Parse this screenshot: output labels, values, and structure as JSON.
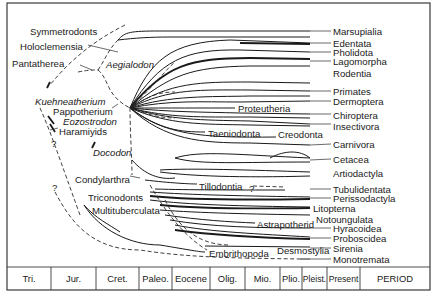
{
  "diagram": {
    "title": "",
    "frame": {
      "x": 7,
      "y": 3,
      "w": 423,
      "h": 287,
      "period_row_y": 267
    },
    "right_labels": [
      {
        "text": "Marsupialia",
        "y": 31
      },
      {
        "text": "Edentata",
        "y": 43
      },
      {
        "text": "Pholidota",
        "y": 52
      },
      {
        "text": "Lagomorpha",
        "y": 61
      },
      {
        "text": "Rodentia",
        "y": 73
      },
      {
        "text": "Primates",
        "y": 91
      },
      {
        "text": "Dermoptera",
        "y": 101
      },
      {
        "text": "Chiroptera",
        "y": 115
      },
      {
        "text": "Insectivora",
        "y": 126
      },
      {
        "text": "Carnivora",
        "y": 144
      },
      {
        "text": "Cetacea",
        "y": 159
      },
      {
        "text": "Artiodactyla",
        "y": 173
      },
      {
        "text": "Tubulidentata",
        "y": 189
      },
      {
        "text": "Perissodactyla",
        "y": 198
      },
      {
        "text": "Litopterna",
        "y": 208,
        "x": 313
      },
      {
        "text": "Notoungulata",
        "y": 219,
        "x": 316
      },
      {
        "text": "Hyracoidea",
        "y": 228
      },
      {
        "text": "Proboscidea",
        "y": 238
      },
      {
        "text": "Sirenia",
        "y": 248
      },
      {
        "text": "Monotremata",
        "y": 259
      }
    ],
    "left_labels": [
      {
        "text": "Symmetrodonts",
        "x": 30,
        "y": 31,
        "italic": false
      },
      {
        "text": "Holoclemensia",
        "x": 20,
        "y": 46,
        "italic": false
      },
      {
        "text": "Pantatherea",
        "x": 12,
        "y": 63,
        "italic": false
      },
      {
        "text": "Aegialodon",
        "x": 106,
        "y": 64,
        "italic": true
      },
      {
        "text": "Kuehneatherium",
        "x": 35,
        "y": 101,
        "italic": true
      },
      {
        "text": "Pappotherium",
        "x": 53,
        "y": 111,
        "italic": false
      },
      {
        "text": "Eozostrodon",
        "x": 63,
        "y": 121,
        "italic": true
      },
      {
        "text": "Haramiyids",
        "x": 59,
        "y": 131,
        "italic": false
      },
      {
        "text": "?",
        "x": 51,
        "y": 143,
        "italic": false
      },
      {
        "text": "Docodon",
        "x": 93,
        "y": 152,
        "italic": true
      },
      {
        "text": "Condylarthra",
        "x": 75,
        "y": 179,
        "italic": false
      },
      {
        "text": "?",
        "x": 52,
        "y": 187,
        "italic": false
      },
      {
        "text": "Triconodonts",
        "x": 88,
        "y": 197,
        "italic": false
      },
      {
        "text": "Multituberculata",
        "x": 92,
        "y": 210,
        "italic": false
      }
    ],
    "inline_labels": [
      {
        "text": "Proteutheria",
        "x": 238,
        "y": 108
      },
      {
        "text": "Taeniodonta",
        "x": 208,
        "y": 133
      },
      {
        "text": "Creodonta",
        "x": 278,
        "y": 134
      },
      {
        "text": "Tillodontia",
        "x": 199,
        "y": 186
      },
      {
        "text": "?",
        "x": 249,
        "y": 188
      },
      {
        "text": "Astrapotherid",
        "x": 257,
        "y": 224
      },
      {
        "text": "Embrithopoda",
        "x": 209,
        "y": 253
      },
      {
        "text": "Desmostylia",
        "x": 277,
        "y": 250
      }
    ],
    "period_bar": {
      "cells": [
        {
          "label": "Tri.",
          "x0": 7,
          "x1": 51
        },
        {
          "label": "Jur.",
          "x0": 51,
          "x1": 96
        },
        {
          "label": "Cret.",
          "x0": 96,
          "x1": 139
        },
        {
          "label": "Paleo.",
          "x0": 139,
          "x1": 172
        },
        {
          "label": "Eocene",
          "x0": 172,
          "x1": 210
        },
        {
          "label": "Olig.",
          "x0": 210,
          "x1": 245
        },
        {
          "label": "Mio.",
          "x0": 245,
          "x1": 280
        },
        {
          "label": "Plio.",
          "x0": 280,
          "x1": 302
        },
        {
          "label": "Pleist.",
          "x0": 302,
          "x1": 327
        },
        {
          "label": "Present",
          "x0": 327,
          "x1": 360
        },
        {
          "label": "PERIOD",
          "x0": 360,
          "x1": 430
        }
      ]
    }
  }
}
